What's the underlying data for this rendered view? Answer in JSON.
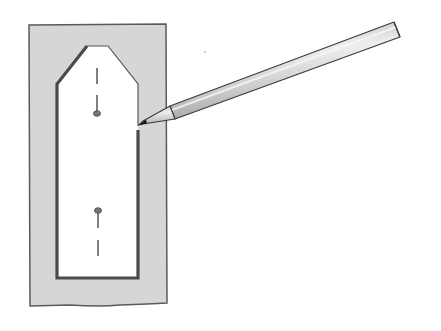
{
  "illustration": {
    "description": "Pencil tracing the outline of a pattern template placed on fabric",
    "colors": {
      "background": "#ffffff",
      "fabric_fill": "#d6d6d6",
      "fabric_outline": "#5a5a5a",
      "template_fill": "#ffffff",
      "traced_line": "#4a4a4a",
      "pencil_body": "#d2d2d2",
      "pencil_highlight": "#eeeeee",
      "pencil_outline": "#3a3a3a",
      "pencil_lead": "#1a1a1a"
    },
    "elements": {
      "fabric": "fabric-rectangle",
      "template": "pattern-template",
      "pencil": "pencil",
      "markers": [
        "top-dart-marker",
        "bottom-dart-marker"
      ]
    }
  }
}
